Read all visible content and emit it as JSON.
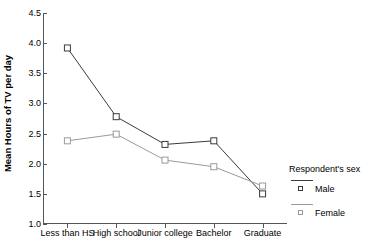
{
  "chart_data": {
    "type": "line",
    "title": "",
    "xlabel": "",
    "ylabel": "Mean Hours of TV per day",
    "categories": [
      "Less than HS",
      "High school",
      "Junior college",
      "Bachelor",
      "Graduate"
    ],
    "series": [
      {
        "name": "Male",
        "color": "#3a3a3a",
        "values": [
          3.92,
          2.78,
          2.32,
          2.38,
          1.5
        ]
      },
      {
        "name": "Female",
        "color": "#9a9a9a",
        "values": [
          2.38,
          2.49,
          2.06,
          1.95,
          1.63
        ]
      }
    ],
    "ylim": [
      1.0,
      4.5
    ],
    "yticks": [
      1.0,
      1.5,
      2.0,
      2.5,
      3.0,
      3.5,
      4.0,
      4.5
    ],
    "ytick_labels": [
      "1.0",
      "1.5",
      "2.0",
      "2.5",
      "3.0",
      "3.5",
      "4.0",
      "4.5"
    ],
    "grid": false,
    "marker": "open-square",
    "legend_position": "right-bottom-outside"
  },
  "legend": {
    "title": "Respondent's sex",
    "entries": [
      {
        "label": "Male"
      },
      {
        "label": "Female"
      }
    ]
  }
}
